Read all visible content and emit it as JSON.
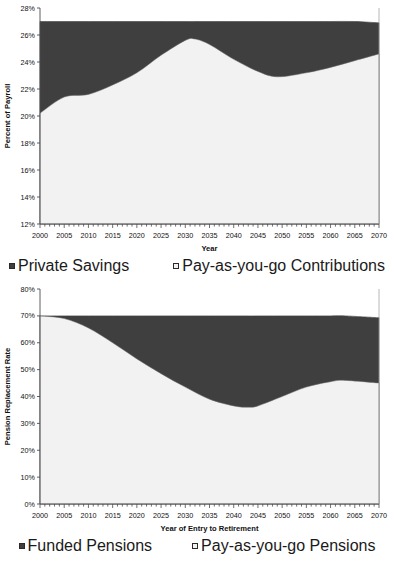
{
  "charts": [
    {
      "id": "percent-of-payroll",
      "ylabel": "Percent of Payroll",
      "xlabel": "Year",
      "ytick_labels": [
        "28%",
        "26%",
        "24%",
        "22%",
        "20%",
        "18%",
        "16%",
        "14%",
        "12%"
      ],
      "xtick_labels": [
        "2000",
        "2005",
        "2010",
        "2015",
        "2020",
        "2025",
        "2030",
        "2035",
        "2040",
        "2045",
        "2050",
        "2055",
        "2060",
        "2065",
        "2070"
      ],
      "legend": [
        {
          "label": "Private Savings",
          "swatch": "dark"
        },
        {
          "label": "Pay-as-you-go Contributions",
          "swatch": "light"
        }
      ]
    },
    {
      "id": "pension-replacement-rate",
      "ylabel": "Pension Replacement Rate",
      "xlabel": "Year of Entry to Retirement",
      "ytick_labels": [
        "80%",
        "70%",
        "60%",
        "50%",
        "40%",
        "30%",
        "20%",
        "10%",
        "0%"
      ],
      "xtick_labels": [
        "2000",
        "2005",
        "2010",
        "2015",
        "2020",
        "2025",
        "2030",
        "2035",
        "2040",
        "2045",
        "2050",
        "2055",
        "2060",
        "2065",
        "2070"
      ],
      "legend": [
        {
          "label": "Funded Pensions",
          "swatch": "dark"
        },
        {
          "label": "Pay-as-you-go Pensions",
          "swatch": "light"
        }
      ]
    }
  ],
  "colors": {
    "dark_fill": "#3f3f3f",
    "light_fill": "#f2f2f2",
    "axis": "#4d4d4d",
    "text": "#111111"
  },
  "chart_data": [
    {
      "type": "area",
      "stacked": true,
      "title": "",
      "xlabel": "Year",
      "ylabel": "Percent of Payroll",
      "xlim": [
        2000,
        2070
      ],
      "ylim": [
        12,
        28
      ],
      "ytick_values": [
        12,
        14,
        16,
        18,
        20,
        22,
        24,
        26,
        28
      ],
      "xtick_values": [
        2000,
        2005,
        2010,
        2015,
        2020,
        2025,
        2030,
        2035,
        2040,
        2045,
        2050,
        2055,
        2060,
        2065,
        2070
      ],
      "minor_xticks": "annual",
      "grid": false,
      "legend_position": "bottom",
      "x": [
        2000,
        2005,
        2010,
        2015,
        2020,
        2025,
        2030,
        2032,
        2035,
        2040,
        2045,
        2049,
        2055,
        2060,
        2065,
        2070
      ],
      "series": [
        {
          "name": "Pay-as-you-go Contributions",
          "color": "#f2f2f2",
          "values": [
            20.2,
            21.4,
            21.6,
            22.3,
            23.2,
            24.5,
            25.6,
            25.7,
            25.3,
            24.2,
            23.3,
            22.9,
            23.2,
            23.6,
            24.1,
            24.6
          ]
        },
        {
          "name": "Private Savings",
          "color": "#3f3f3f",
          "values": [
            6.8,
            5.6,
            5.4,
            4.7,
            3.8,
            2.5,
            1.4,
            1.3,
            1.7,
            2.8,
            3.7,
            4.1,
            3.8,
            3.4,
            2.9,
            2.3
          ]
        }
      ],
      "total": [
        27.0,
        27.0,
        27.0,
        27.0,
        27.0,
        27.0,
        27.0,
        27.0,
        27.0,
        27.0,
        27.0,
        27.0,
        27.0,
        27.0,
        27.0,
        26.9
      ]
    },
    {
      "type": "area",
      "stacked": true,
      "title": "",
      "xlabel": "Year of Entry to Retirement",
      "ylabel": "Pension Replacement Rate",
      "xlim": [
        2000,
        2070
      ],
      "ylim": [
        0,
        80
      ],
      "ytick_values": [
        0,
        10,
        20,
        30,
        40,
        50,
        60,
        70,
        80
      ],
      "xtick_values": [
        2000,
        2005,
        2010,
        2015,
        2020,
        2025,
        2030,
        2035,
        2040,
        2045,
        2050,
        2055,
        2060,
        2065,
        2070
      ],
      "minor_xticks": "annual",
      "grid": false,
      "legend_position": "bottom",
      "x": [
        2000,
        2005,
        2010,
        2015,
        2020,
        2025,
        2030,
        2035,
        2040,
        2043,
        2045,
        2050,
        2055,
        2060,
        2063,
        2070
      ],
      "series": [
        {
          "name": "Pay-as-you-go Pensions",
          "color": "#f2f2f2",
          "values": [
            70.0,
            69.0,
            65.5,
            60.0,
            54.0,
            48.5,
            43.5,
            39.0,
            36.5,
            36.0,
            36.5,
            40.0,
            43.5,
            45.5,
            46.0,
            45.0
          ]
        },
        {
          "name": "Funded Pensions",
          "color": "#3f3f3f",
          "values": [
            0.0,
            1.0,
            4.5,
            10.0,
            16.0,
            21.5,
            26.5,
            31.0,
            33.5,
            34.0,
            33.5,
            30.0,
            26.5,
            24.5,
            24.0,
            24.3
          ]
        }
      ],
      "total": [
        70.0,
        70.0,
        70.0,
        70.0,
        70.0,
        70.0,
        70.0,
        70.0,
        70.0,
        70.0,
        70.0,
        70.0,
        70.0,
        70.0,
        70.0,
        69.3
      ]
    }
  ]
}
